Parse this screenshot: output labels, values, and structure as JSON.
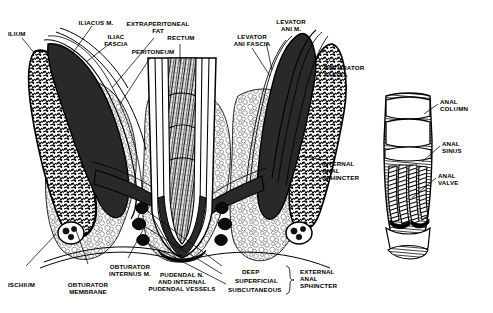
{
  "figure": {
    "background_color": "#ffffff",
    "ink_color": "#000000",
    "width": 493,
    "height": 313
  },
  "labels": {
    "ilium": "ILIUM",
    "iliacus_m": "ILIACUS M.",
    "iliac_fascia": "ILIAC\nFASCIA",
    "extraperitoneal_fat": "EXTRAPERITONEAL\nFAT",
    "peritoneum": "PERITONEUM",
    "rectum": "RECTUM",
    "levator_ani_fascia": "LEVATOR\nANI FASCIA",
    "levator_ani_m": "LEVATOR\nANI M.",
    "obturator_fascia": "OBTURATOR\nFASCIA",
    "internal_anal_sphincter": "INTERNAL\nANAL\nSPHINCTER",
    "ischium": "ISCHIUM",
    "obturator_membrane": "OBTURATOR\nMEMBRANE",
    "obturator_internus_m": "OBTURATOR\nINTERNUS M.",
    "pudendal_nerve_vessels": "PUDENDAL N.\nAND INTERNAL\nPUDENDAL VESSELS",
    "deep": "DEEP",
    "superficial": "SUPERFICIAL",
    "subcutaneous": "SUBCUTANEOUS",
    "external_anal_sphincter": "EXTERNAL\nANAL\nSPHINCTER",
    "anal_column": "ANAL\nCOLUMN",
    "anal_sinus": "ANAL\nSINUS",
    "anal_valve": "ANAL\nVALVE"
  }
}
